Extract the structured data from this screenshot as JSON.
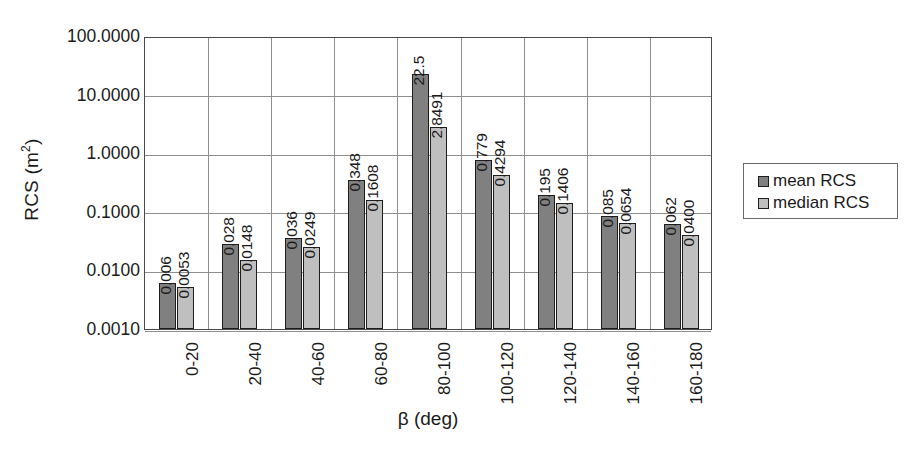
{
  "chart_data": {
    "type": "bar",
    "title": "",
    "xlabel": "β (deg)",
    "ylabel": "RCS (m²)",
    "ylabel_base": "RCS (m",
    "ylabel_sup": "2",
    "ylabel_tail": ")",
    "yscale": "log",
    "ylim": [
      0.001,
      100
    ],
    "grid": true,
    "legend_position": "right",
    "categories": [
      "0-20",
      "20-40",
      "40-60",
      "60-80",
      "80-100",
      "100-120",
      "120-140",
      "140-160",
      "160-180"
    ],
    "ytick_labels": [
      "100.0000",
      "10.0000",
      "1.0000",
      "0.1000",
      "0.0100",
      "0.0010"
    ],
    "ytick_values": [
      100,
      10,
      1,
      0.1,
      0.01,
      0.001
    ],
    "series": [
      {
        "name": "mean RCS",
        "color": "#808080",
        "values": [
          0.006,
          0.028,
          0.036,
          0.348,
          22.5,
          0.779,
          0.195,
          0.085,
          0.062
        ],
        "labels": [
          "0.006",
          "0.028",
          "0.036",
          "0.348",
          "22.5",
          "0.779",
          "0.195",
          "0.085",
          "0.062"
        ]
      },
      {
        "name": "median RCS",
        "color": "#bfbfbf",
        "values": [
          0.0053,
          0.0148,
          0.0249,
          0.1608,
          2.8491,
          0.4294,
          0.1406,
          0.0654,
          0.04
        ],
        "labels": [
          "0.0053",
          "0.0148",
          "0.0249",
          "0.1608",
          "2.8491",
          "0.4294",
          "0.1406",
          "0.0654",
          "0.0400"
        ]
      }
    ]
  },
  "legend": {
    "items": [
      {
        "label": "mean RCS",
        "swatch": "mean"
      },
      {
        "label": "median RCS",
        "swatch": "median"
      }
    ]
  }
}
